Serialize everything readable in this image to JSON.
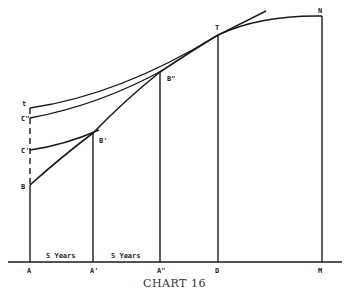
{
  "caption": "CHART 16",
  "colors": {
    "ink": "#1a1a1a",
    "background": "#ffffff"
  },
  "points": {
    "t": "t",
    "C2": "C\"",
    "C1": "C'",
    "B": "B",
    "B1": "B'",
    "B2": "B\"",
    "T": "T",
    "N": "N",
    "A": "A",
    "A1": "A'",
    "A2": "A\"",
    "D": "D",
    "M": "M"
  },
  "intervals": {
    "first": "5 Years",
    "second": "5 Years"
  }
}
